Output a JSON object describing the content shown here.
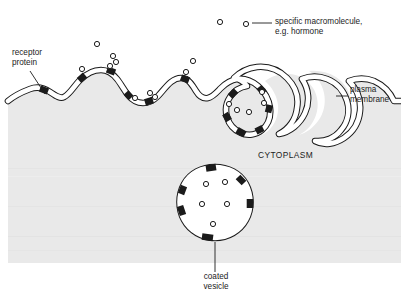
{
  "figure": {
    "domain": "biology-cell-diagram",
    "background_color": "#ffffff",
    "cytoplasm_color": "#e9e9e9",
    "ink_color": "#1b1b1b",
    "membrane_fill": "#ffffff"
  },
  "labels": {
    "receptor_protein": "receptor\nprotein",
    "receptor_protein_line1": "receptor",
    "receptor_protein_line2": "protein",
    "macromolecule_line1": "specific macromolecule,",
    "macromolecule_line2": "e.g. hormone",
    "plasma_membrane_line1": "plasma",
    "plasma_membrane_line2": "membrane",
    "cytoplasm": "CYTOPLASM",
    "coated_vesicle_line1": "coated",
    "coated_vesicle_line2": "vesicle"
  },
  "elements": {
    "free_macromolecules": [
      {
        "cx": 220,
        "cy": 22,
        "r": 2.6
      },
      {
        "cx": 246,
        "cy": 24,
        "r": 2.6
      },
      {
        "cx": 97,
        "cy": 44,
        "r": 2.6
      },
      {
        "cx": 113,
        "cy": 56,
        "r": 2.6
      },
      {
        "cx": 193,
        "cy": 61,
        "r": 2.6
      }
    ],
    "bound_macromolecules": [
      {
        "cx": 82,
        "cy": 69,
        "r": 2.6
      },
      {
        "cx": 110,
        "cy": 66,
        "r": 2.6
      },
      {
        "cx": 116,
        "cy": 62,
        "r": 2.6
      },
      {
        "cx": 135,
        "cy": 98,
        "r": 2.6
      },
      {
        "cx": 150,
        "cy": 93,
        "r": 2.6
      },
      {
        "cx": 155,
        "cy": 97,
        "r": 2.6
      },
      {
        "cx": 186,
        "cy": 72,
        "r": 2.6
      },
      {
        "cx": 229,
        "cy": 104,
        "r": 2.6
      },
      {
        "cx": 237,
        "cy": 110,
        "r": 2.6
      },
      {
        "cx": 249,
        "cy": 112,
        "r": 2.6
      },
      {
        "cx": 262,
        "cy": 92,
        "r": 2.6
      },
      {
        "cx": 264,
        "cy": 103,
        "r": 2.6
      }
    ],
    "vesicle_macromolecules": [
      {
        "cx": 206,
        "cy": 184,
        "r": 2.6
      },
      {
        "cx": 225,
        "cy": 182,
        "r": 2.6
      },
      {
        "cx": 202,
        "cy": 204,
        "r": 2.6
      },
      {
        "cx": 227,
        "cy": 204,
        "r": 2.6
      },
      {
        "cx": 213,
        "cy": 224,
        "r": 2.6
      }
    ],
    "coated_vesicle": {
      "cx": 215,
      "cy": 205,
      "rx": 31,
      "ry": 38
    },
    "receptor_patch_count_membrane": 12,
    "receptor_patch_count_vesicle": 6
  },
  "leader_lines": {
    "receptor_protein": {
      "x1": 30,
      "y1": 70,
      "x2": 45,
      "y2": 95
    },
    "macromolecule": {
      "x1": 253,
      "y1": 23,
      "x2": 272,
      "y2": 23
    },
    "plasma_membrane": {
      "x1": 337,
      "y1": 96,
      "x2": 348,
      "y2": 96
    },
    "coated_vesicle": {
      "x1": 215,
      "y1": 243,
      "x2": 215,
      "y2": 272
    }
  }
}
